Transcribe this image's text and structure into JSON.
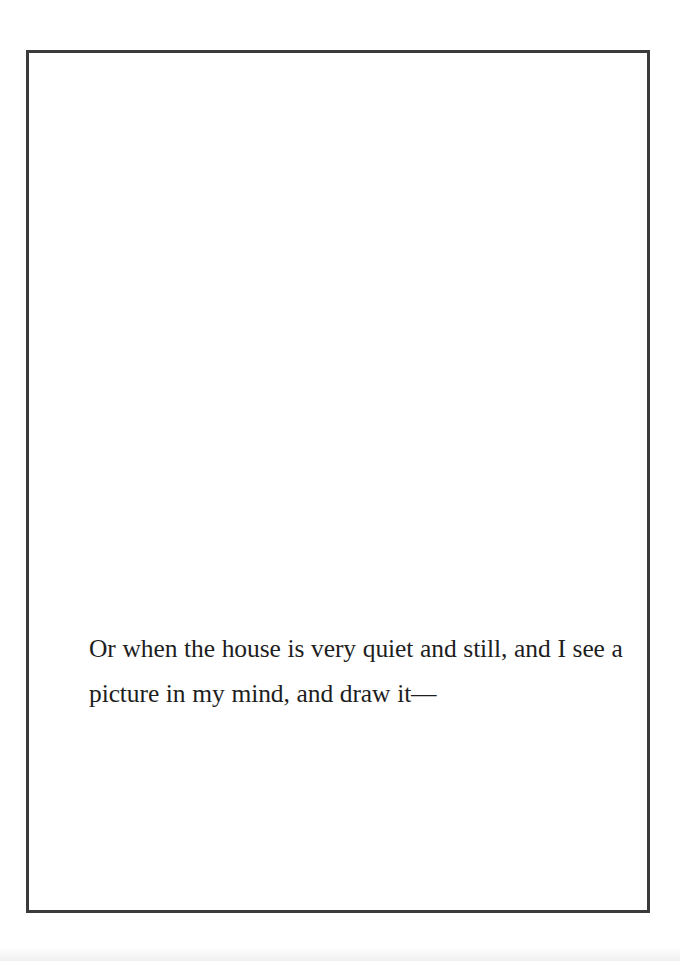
{
  "page": {
    "border_color": "#3b3b3b",
    "text_color": "#1e1e1e",
    "background": "#ffffff"
  },
  "passage": {
    "lines": [
      "Or when the house is very quiet and still, and I see a",
      "picture in my mind, and draw it—"
    ]
  }
}
